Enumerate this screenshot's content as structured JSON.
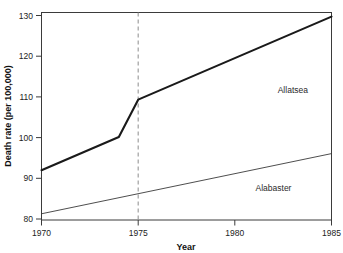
{
  "chart_data": {
    "type": "line",
    "title": "",
    "subtitle": "",
    "xlabel": "Year",
    "ylabel": "Death rate (per 100,000)",
    "xlim": [
      1970,
      1985
    ],
    "ylim": [
      80,
      130
    ],
    "grid": false,
    "legend_position": "inline-annotation",
    "xticks": [
      1970,
      1975,
      1980,
      1985
    ],
    "xtick_labels": [
      "1970",
      "1975",
      "1980",
      "1985"
    ],
    "yticks": [
      80,
      90,
      100,
      110,
      120,
      130
    ],
    "ytick_labels": [
      "80",
      "90",
      "100",
      "110",
      "120",
      "130"
    ],
    "annotations": [
      {
        "name": "intervention-line",
        "type": "vertical-reference-line",
        "x": 1975,
        "style": "dashed",
        "color": "#8c8c8c"
      }
    ],
    "series": [
      {
        "name": "Allatsea",
        "label": "Allatsea",
        "color": "#1a1a1a",
        "line_width": 2.1,
        "x": [
          1970,
          1974,
          1975,
          1985
        ],
        "values": [
          92,
          100,
          109,
          129
        ],
        "label_x": 1983.0,
        "label_y": 110.5
      },
      {
        "name": "Alabaster",
        "label": "Alabaster",
        "color": "#3a3a3a",
        "line_width": 0.9,
        "x": [
          1970,
          1985
        ],
        "values": [
          81.5,
          96
        ],
        "label_x": 1982.0,
        "label_y": 87.0
      }
    ]
  },
  "axes": {
    "x_axis_title": "Year",
    "y_axis_title": "Death rate (per 100,000)"
  },
  "ticks": {
    "x": [
      "1970",
      "1975",
      "1980",
      "1985"
    ],
    "y": [
      "130",
      "120",
      "110",
      "100",
      "90",
      "80"
    ]
  },
  "series_labels": {
    "top": "Allatsea",
    "bottom": "Alabaster"
  },
  "colors": {
    "axis": "#1a1a1a",
    "series_top": "#1a1a1a",
    "series_bottom": "#3a3a3a",
    "reference_line": "#8c8c8c",
    "background": "#ffffff"
  }
}
